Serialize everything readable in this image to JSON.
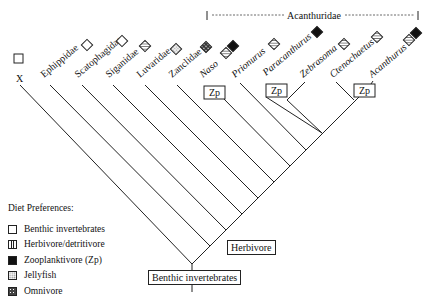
{
  "clade_label": "Acanthuridae",
  "taxa": [
    {
      "name": "X",
      "italic": false,
      "diet": [
        "benthic"
      ]
    },
    {
      "name": "Ephippidae",
      "italic": false,
      "diet": [
        "benthic"
      ]
    },
    {
      "name": "Scatophagidae",
      "italic": false,
      "diet": [
        "benthic"
      ]
    },
    {
      "name": "Siganidae",
      "italic": false,
      "diet": [
        "herbivore"
      ]
    },
    {
      "name": "Luvaridae",
      "italic": false,
      "diet": [
        "jellyfish"
      ]
    },
    {
      "name": "Zanclidae",
      "italic": false,
      "diet": [
        "omnivore"
      ]
    },
    {
      "name": "Naso",
      "italic": true,
      "diet": [
        "herbivore",
        "zooplanktivore"
      ]
    },
    {
      "name": "Prionurus",
      "italic": true,
      "diet": [
        "herbivore"
      ]
    },
    {
      "name": "Paracanthurus",
      "italic": true,
      "diet": [
        "zooplanktivore"
      ]
    },
    {
      "name": "Zebrasoma",
      "italic": true,
      "diet": [
        "herbivore"
      ]
    },
    {
      "name": "Ctenochaetus",
      "italic": true,
      "diet": [
        "herbivore"
      ]
    },
    {
      "name": "Acanthurus",
      "italic": true,
      "diet": [
        "herbivore",
        "zooplanktivore"
      ]
    }
  ],
  "node_labels": {
    "root": "Benthic invertebrates",
    "herbivore": "Herbivore",
    "zp": "Zp"
  },
  "legend": {
    "title": "Diet Preferences:",
    "items": [
      {
        "key": "benthic",
        "label": "Benthic invertebrates"
      },
      {
        "key": "herbivore",
        "label": "Herbivore/detritivore"
      },
      {
        "key": "zooplanktivore",
        "label": "Zooplanktivore (Zp)"
      },
      {
        "key": "jellyfish",
        "label": "Jellyfish"
      },
      {
        "key": "omnivore",
        "label": "Omnivore"
      }
    ]
  }
}
